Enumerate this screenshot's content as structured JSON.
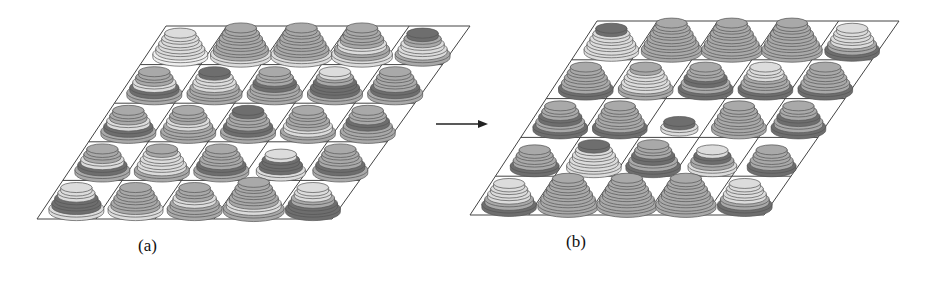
{
  "figure": {
    "panels": [
      {
        "id": "a",
        "label": "(a)",
        "label_pos": [
          138,
          246
        ],
        "grid": {
          "rows": 5,
          "cols": 5,
          "tl": [
            166,
            26
          ],
          "tr": [
            470,
            26
          ],
          "bl": [
            37,
            219
          ],
          "br": [
            332,
            219
          ]
        },
        "stacks": [
          [
            [
              5,
              "L",
              "L",
              "L",
              "L",
              "XL"
            ],
            [
              6,
              "M",
              "M",
              "M",
              "M",
              "M",
              "L"
            ],
            [
              6,
              "M",
              "M",
              "M",
              "M",
              "M",
              "L"
            ],
            [
              6,
              "M",
              "M",
              "M",
              "L",
              "M",
              "L"
            ],
            [
              5,
              "D",
              "M",
              "L",
              "L",
              "M"
            ]
          ],
          [
            [
              5,
              "M",
              "M",
              "L",
              "D",
              "M"
            ],
            [
              5,
              "D",
              "L",
              "L",
              "M",
              "M"
            ],
            [
              5,
              "M",
              "M",
              "D",
              "M",
              "M"
            ],
            [
              5,
              "L",
              "M",
              "D",
              "D",
              "M"
            ],
            [
              5,
              "M",
              "M",
              "M",
              "D",
              "M"
            ]
          ],
          [
            [
              5,
              "M",
              "M",
              "L",
              "D",
              "M"
            ],
            [
              5,
              "M",
              "M",
              "L",
              "M",
              "M"
            ],
            [
              5,
              "D",
              "M",
              "M",
              "D",
              "M"
            ],
            [
              5,
              "M",
              "M",
              "M",
              "L",
              "M"
            ],
            [
              5,
              "M",
              "M",
              "D",
              "M",
              "M"
            ]
          ],
          [
            [
              5,
              "M",
              "M",
              "L",
              "D",
              "M"
            ],
            [
              5,
              "M",
              "L",
              "L",
              "L",
              "M"
            ],
            [
              5,
              "M",
              "M",
              "M",
              "D",
              "M"
            ],
            [
              4,
              "L",
              "D",
              "D",
              "L"
            ],
            [
              5,
              "M",
              "M",
              "M",
              "D",
              "M"
            ]
          ],
          [
            [
              5,
              "L",
              "L",
              "D",
              "D",
              "L"
            ],
            [
              5,
              "M",
              "M",
              "M",
              "M",
              "L"
            ],
            [
              5,
              "M",
              "M",
              "L",
              "M",
              "M"
            ],
            [
              6,
              "M",
              "M",
              "M",
              "M",
              "L",
              "M"
            ],
            [
              5,
              "L",
              "L",
              "M",
              "D",
              "D"
            ]
          ]
        ]
      },
      {
        "id": "b",
        "label": "(b)",
        "label_pos": [
          566,
          246
        ],
        "grid": {
          "rows": 5,
          "cols": 5,
          "tl": [
            597,
            21
          ],
          "tr": [
            899,
            21
          ],
          "bl": [
            470,
            215
          ],
          "br": [
            764,
            215
          ]
        },
        "stacks": [
          [
            [
              5,
              "D",
              "L",
              "L",
              "L",
              "L"
            ],
            [
              6,
              "M",
              "M",
              "M",
              "M",
              "M",
              "M"
            ],
            [
              6,
              "M",
              "M",
              "M",
              "M",
              "M",
              "M"
            ],
            [
              6,
              "M",
              "M",
              "M",
              "M",
              "M",
              "M"
            ],
            [
              5,
              "L",
              "L",
              "L",
              "M",
              "D"
            ]
          ],
          [
            [
              5,
              "M",
              "M",
              "M",
              "M",
              "D"
            ],
            [
              5,
              "M",
              "L",
              "L",
              "L",
              "M"
            ],
            [
              5,
              "M",
              "M",
              "D",
              "M",
              "D"
            ],
            [
              5,
              "L",
              "L",
              "M",
              "M",
              "D"
            ],
            [
              5,
              "M",
              "M",
              "M",
              "M",
              "D"
            ]
          ],
          [
            [
              5,
              "M",
              "M",
              "D",
              "M",
              "D"
            ],
            [
              5,
              "M",
              "M",
              "M",
              "M",
              "D"
            ],
            [
              2,
              "D",
              "L"
            ],
            [
              5,
              "M",
              "M",
              "M",
              "M",
              "M"
            ],
            [
              5,
              "M",
              "M",
              "D",
              "M",
              "D"
            ]
          ],
          [
            [
              4,
              "M",
              "M",
              "M",
              "D"
            ],
            [
              5,
              "D",
              "L",
              "L",
              "L",
              "L"
            ],
            [
              5,
              "M",
              "M",
              "D",
              "M",
              "D"
            ],
            [
              4,
              "L",
              "D",
              "M",
              "L"
            ],
            [
              4,
              "M",
              "M",
              "M",
              "D"
            ]
          ],
          [
            [
              5,
              "L",
              "L",
              "L",
              "M",
              "D"
            ],
            [
              6,
              "M",
              "M",
              "M",
              "M",
              "M",
              "M"
            ],
            [
              6,
              "M",
              "M",
              "M",
              "M",
              "M",
              "M"
            ],
            [
              6,
              "M",
              "M",
              "M",
              "M",
              "M",
              "M"
            ],
            [
              5,
              "L",
              "L",
              "L",
              "M",
              "D"
            ]
          ]
        ]
      }
    ],
    "arrow": {
      "x1": 436,
      "y1": 124,
      "x2": 488,
      "y2": 124
    },
    "colors": {
      "L": "#dcdcdc",
      "XL": "#efefef",
      "M": "#a9a9a9",
      "D": "#6e6e6e",
      "line": "#555555",
      "grid": "#444444"
    }
  }
}
